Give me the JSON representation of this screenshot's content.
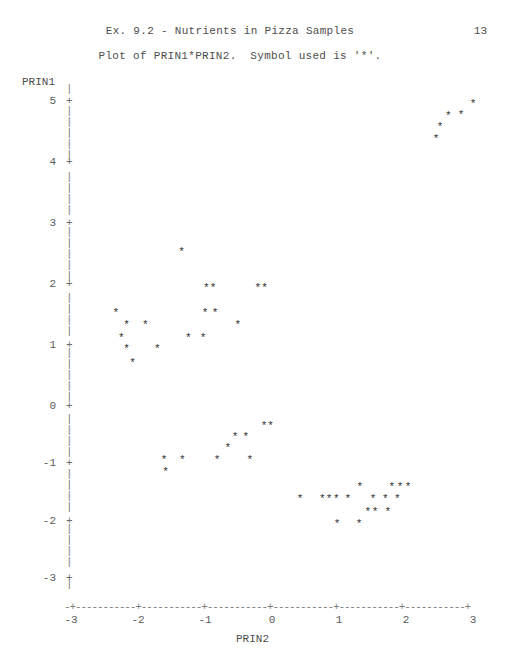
{
  "header": {
    "title": "Ex. 9.2 - Nutrients in Pizza Samples",
    "page_number": "13",
    "subtitle": "Plot of PRIN1*PRIN2.  Symbol used is '*'."
  },
  "axes": {
    "y_title": "PRIN1",
    "x_title": "PRIN2",
    "y_axis_glyph": "|",
    "y_tick_glyph": "+",
    "x_axis_glyph": "-+-----------+-----------+-----------+-----------+-----------+-----------+",
    "symbol": "*"
  },
  "chart_data": {
    "type": "scatter",
    "title": "Ex. 9.2 - Nutrients in Pizza Samples",
    "subtitle": "Plot of PRIN1*PRIN2.  Symbol used is '*'.",
    "xlabel": "PRIN2",
    "ylabel": "PRIN1",
    "xlim": [
      -3,
      3
    ],
    "ylim": [
      -3.4,
      5.4
    ],
    "xticks": [
      -3,
      -2,
      -1,
      0,
      1,
      2,
      3
    ],
    "xtick_labels": [
      "-3",
      "-2",
      "-1",
      "0",
      "1",
      "2",
      "3"
    ],
    "yticks": [
      5,
      4,
      3,
      2,
      1,
      0,
      -1,
      -2,
      -3
    ],
    "ytick_labels": [
      "5",
      "4",
      "3",
      "2",
      "1",
      "0",
      "-1",
      "-2",
      "-3"
    ],
    "grid": false,
    "legend": false,
    "marker": "*",
    "marker_color": "#2e2e2e",
    "n_points": 50,
    "points": [
      {
        "x": 2.51,
        "y": 4.58
      },
      {
        "x": 2.63,
        "y": 4.75
      },
      {
        "x": 2.82,
        "y": 4.77
      },
      {
        "x": 3.0,
        "y": 4.95
      },
      {
        "x": 2.45,
        "y": 4.38
      },
      {
        "x": -1.35,
        "y": 2.52
      },
      {
        "x": -0.98,
        "y": 1.94
      },
      {
        "x": -0.88,
        "y": 1.94
      },
      {
        "x": -0.21,
        "y": 1.94
      },
      {
        "x": -0.11,
        "y": 1.94
      },
      {
        "x": -2.33,
        "y": 1.52
      },
      {
        "x": -1.0,
        "y": 1.52
      },
      {
        "x": -0.85,
        "y": 1.52
      },
      {
        "x": -2.17,
        "y": 1.32
      },
      {
        "x": -1.89,
        "y": 1.32
      },
      {
        "x": -0.51,
        "y": 1.32
      },
      {
        "x": -2.25,
        "y": 1.11
      },
      {
        "x": -1.25,
        "y": 1.11
      },
      {
        "x": -1.03,
        "y": 1.11
      },
      {
        "x": -2.17,
        "y": 0.94
      },
      {
        "x": -1.71,
        "y": 0.94
      },
      {
        "x": -2.08,
        "y": 0.71
      },
      {
        "x": -0.12,
        "y": -0.35
      },
      {
        "x": -0.02,
        "y": -0.35
      },
      {
        "x": -0.55,
        "y": -0.54
      },
      {
        "x": -0.39,
        "y": -0.54
      },
      {
        "x": -0.66,
        "y": -0.73
      },
      {
        "x": -1.61,
        "y": -0.95
      },
      {
        "x": -1.34,
        "y": -0.95
      },
      {
        "x": -0.82,
        "y": -0.95
      },
      {
        "x": -0.33,
        "y": -0.95
      },
      {
        "x": -1.59,
        "y": -1.15
      },
      {
        "x": 1.31,
        "y": -1.42
      },
      {
        "x": 1.79,
        "y": -1.42
      },
      {
        "x": 1.91,
        "y": -1.42
      },
      {
        "x": 2.03,
        "y": -1.42
      },
      {
        "x": 0.42,
        "y": -1.63
      },
      {
        "x": 0.75,
        "y": -1.63
      },
      {
        "x": 0.85,
        "y": -1.63
      },
      {
        "x": 0.96,
        "y": -1.63
      },
      {
        "x": 1.13,
        "y": -1.63
      },
      {
        "x": 1.51,
        "y": -1.63
      },
      {
        "x": 1.69,
        "y": -1.63
      },
      {
        "x": 1.87,
        "y": -1.63
      },
      {
        "x": 1.43,
        "y": -1.85
      },
      {
        "x": 1.54,
        "y": -1.85
      },
      {
        "x": 1.73,
        "y": -1.85
      },
      {
        "x": 0.97,
        "y": -2.06
      },
      {
        "x": 1.3,
        "y": -2.06
      }
    ]
  }
}
